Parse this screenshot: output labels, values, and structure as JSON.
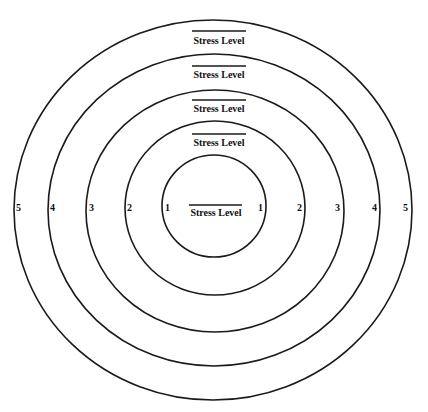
{
  "diagram": {
    "type": "concentric-circles",
    "colors": {
      "line": "#1a1a1a",
      "text": "#111111",
      "background": "#ffffff"
    },
    "rings": [
      {
        "level": "5",
        "title": "Stress Level",
        "left_number": "5",
        "right_number": "5"
      },
      {
        "level": "4",
        "title": "Stress Level",
        "left_number": "4",
        "right_number": "4"
      },
      {
        "level": "3",
        "title": "Stress Level",
        "left_number": "3",
        "right_number": "3"
      },
      {
        "level": "2",
        "title": "Stress Level",
        "left_number": "2",
        "right_number": "2"
      },
      {
        "level": "1",
        "title": "Stress Level",
        "left_number": "1",
        "right_number": "1"
      }
    ]
  }
}
